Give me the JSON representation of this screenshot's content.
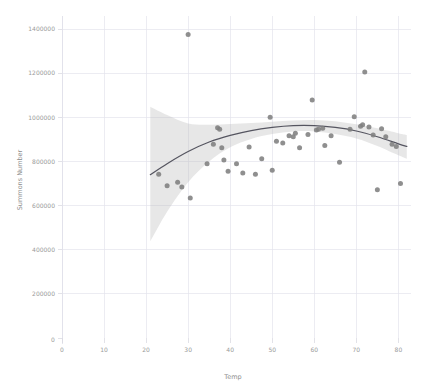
{
  "chart_data": {
    "type": "scatter",
    "title": "",
    "subtitle": "",
    "xlabel": "Temp",
    "ylabel": "Summons Number",
    "xlim": [
      0,
      83
    ],
    "ylim": [
      0,
      1450000
    ],
    "grid": true,
    "legend_position": "none",
    "x_ticks": [
      0,
      10,
      20,
      30,
      40,
      50,
      60,
      70,
      80
    ],
    "x_tick_labels": [
      "0",
      "10",
      "20",
      "30",
      "40",
      "50",
      "60",
      "70",
      "80"
    ],
    "y_ticks": [
      0,
      200000,
      400000,
      600000,
      800000,
      1000000,
      1200000,
      1400000
    ],
    "y_tick_labels": [
      "0",
      "200000",
      "400000",
      "600000",
      "800000",
      "1000000",
      "1200000",
      "1400000"
    ],
    "origin_label": "0",
    "marker_color": "#7f7f7f",
    "line_color": "#555560",
    "band_color": "#b9b9b9",
    "grid_color": "#e4e4ec",
    "background_color": "#ffffff",
    "series": [
      {
        "name": "Summons vs Temp",
        "type": "scatter",
        "points": [
          [
            23.0,
            742000
          ],
          [
            25.0,
            690000
          ],
          [
            27.5,
            706000
          ],
          [
            28.5,
            684000
          ],
          [
            30.0,
            1375000
          ],
          [
            30.5,
            634000
          ],
          [
            34.5,
            790000
          ],
          [
            36.0,
            878000
          ],
          [
            37.0,
            953000
          ],
          [
            37.5,
            946000
          ],
          [
            38.0,
            862000
          ],
          [
            38.5,
            806000
          ],
          [
            39.5,
            756000
          ],
          [
            41.5,
            790000
          ],
          [
            43.0,
            748000
          ],
          [
            44.5,
            866000
          ],
          [
            46.0,
            742000
          ],
          [
            47.5,
            812000
          ],
          [
            49.5,
            1000000
          ],
          [
            50.0,
            760000
          ],
          [
            51.0,
            892000
          ],
          [
            52.5,
            884000
          ],
          [
            54.0,
            916000
          ],
          [
            55.0,
            912000
          ],
          [
            55.5,
            928000
          ],
          [
            56.5,
            862000
          ],
          [
            58.5,
            922000
          ],
          [
            59.5,
            1078000
          ],
          [
            60.5,
            942000
          ],
          [
            61.0,
            946000
          ],
          [
            62.0,
            950000
          ],
          [
            62.5,
            872000
          ],
          [
            64.0,
            916000
          ],
          [
            66.0,
            796000
          ],
          [
            68.5,
            946000
          ],
          [
            69.5,
            1002000
          ],
          [
            71.0,
            960000
          ],
          [
            71.5,
            966000
          ],
          [
            72.0,
            1205000
          ],
          [
            73.0,
            956000
          ],
          [
            74.0,
            920000
          ],
          [
            75.0,
            672000
          ],
          [
            76.0,
            948000
          ],
          [
            77.0,
            912000
          ],
          [
            78.5,
            878000
          ],
          [
            79.5,
            868000
          ],
          [
            80.5,
            700000
          ]
        ]
      },
      {
        "name": "Fitted curve (LOESS)",
        "type": "line",
        "points": [
          [
            21.0,
            740000
          ],
          [
            25.0,
            790000
          ],
          [
            30.0,
            845000
          ],
          [
            35.0,
            888000
          ],
          [
            40.0,
            918000
          ],
          [
            45.0,
            940000
          ],
          [
            50.0,
            954000
          ],
          [
            55.0,
            962000
          ],
          [
            60.0,
            962000
          ],
          [
            65.0,
            954000
          ],
          [
            70.0,
            938000
          ],
          [
            75.0,
            912000
          ],
          [
            80.0,
            880000
          ],
          [
            82.0,
            868000
          ]
        ]
      },
      {
        "name": "95% confidence band (upper)",
        "type": "band-upper",
        "points": [
          [
            21.0,
            1048000
          ],
          [
            25.0,
            1010000
          ],
          [
            30.0,
            972000
          ],
          [
            35.0,
            966000
          ],
          [
            40.0,
            970000
          ],
          [
            45.0,
            974000
          ],
          [
            50.0,
            980000
          ],
          [
            55.0,
            986000
          ],
          [
            60.0,
            988000
          ],
          [
            65.0,
            982000
          ],
          [
            70.0,
            968000
          ],
          [
            75.0,
            950000
          ],
          [
            80.0,
            928000
          ],
          [
            82.0,
            920000
          ]
        ]
      },
      {
        "name": "95% confidence band (lower)",
        "type": "band-lower",
        "points": [
          [
            21.0,
            438000
          ],
          [
            25.0,
            572000
          ],
          [
            30.0,
            706000
          ],
          [
            35.0,
            800000
          ],
          [
            40.0,
            864000
          ],
          [
            45.0,
            902000
          ],
          [
            50.0,
            924000
          ],
          [
            55.0,
            936000
          ],
          [
            60.0,
            936000
          ],
          [
            65.0,
            924000
          ],
          [
            70.0,
            904000
          ],
          [
            75.0,
            870000
          ],
          [
            80.0,
            828000
          ],
          [
            82.0,
            812000
          ]
        ]
      }
    ]
  }
}
